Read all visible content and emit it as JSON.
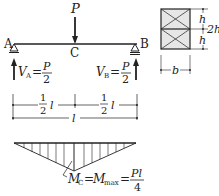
{
  "beam": {
    "load_label": "P",
    "support_a_label": "A",
    "support_b_label": "B",
    "midpoint_label": "C",
    "reaction_a": {
      "symbol": "V",
      "subscript": "A",
      "eq": "=",
      "num": "P",
      "den": "2"
    },
    "reaction_b": {
      "symbol": "V",
      "subscript": "B",
      "eq": "=",
      "num": "P",
      "den": "2"
    }
  },
  "dimensions": {
    "half_left": {
      "num": "1",
      "den": "2",
      "var": "l"
    },
    "half_right": {
      "num": "1",
      "den": "2",
      "var": "l"
    },
    "total": "l"
  },
  "cross_section": {
    "upper_height": "h",
    "lower_height": "h",
    "total_height": "2h",
    "width": "b"
  },
  "moment_diagram": {
    "lhs_symbol": "M",
    "lhs_sub": "C",
    "eq1": "=",
    "mid_symbol": "M",
    "mid_sub": "max",
    "eq2": "=",
    "num": "Pl",
    "den": "4"
  },
  "colors": {
    "stroke": "#222222",
    "section_fill": "#e6e6e6",
    "background": "#ffffff"
  }
}
